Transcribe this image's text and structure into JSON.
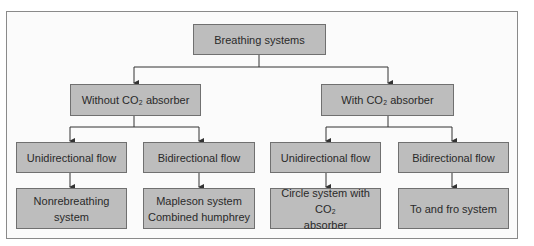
{
  "diagram": {
    "root": {
      "label": "Breathing systems"
    },
    "level2": [
      {
        "label": "Without CO₂ absorber"
      },
      {
        "label": "With CO₂ absorber"
      }
    ],
    "level3": [
      {
        "label": "Unidirectional flow"
      },
      {
        "label": "Bidirectional flow"
      },
      {
        "label": "Unidirectional flow"
      },
      {
        "label": "Bidirectional flow"
      }
    ],
    "level4": [
      {
        "lines": [
          "Nonrebreathing",
          "system"
        ]
      },
      {
        "lines": [
          "Mapleson system",
          "Combined humphrey"
        ]
      },
      {
        "lines": [
          "Circle system with CO₂",
          "absorber"
        ]
      },
      {
        "lines": [
          "To and fro system"
        ]
      }
    ],
    "colors": {
      "box_fill": "#bdbdbd",
      "box_border": "#707070",
      "line": "#333333"
    }
  }
}
